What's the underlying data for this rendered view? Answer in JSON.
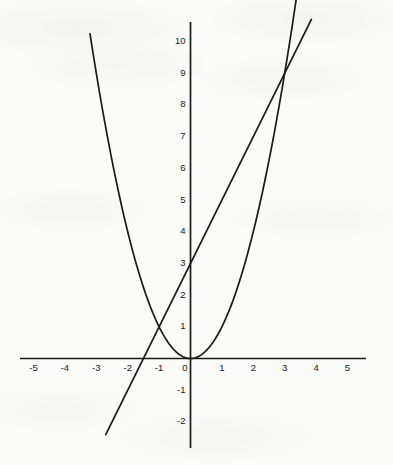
{
  "chart_data": {
    "type": "line",
    "title": "",
    "subtitle": "",
    "xlabel": "",
    "ylabel": "",
    "xlim": [
      -5.4,
      5.5
    ],
    "ylim": [
      -2.6,
      10.7
    ],
    "grid": false,
    "legend": "none",
    "x_ticks": [
      -5,
      -4,
      -3,
      -2,
      -1,
      0,
      1,
      2,
      3,
      4,
      5
    ],
    "x_tick_labels": [
      "-5",
      "-4",
      "-3",
      "-2",
      "-1",
      "0",
      "1",
      "2",
      "3",
      "4",
      "5"
    ],
    "y_ticks": [
      -2,
      -1,
      1,
      2,
      3,
      4,
      5,
      6,
      7,
      8,
      9,
      10
    ],
    "y_tick_labels": [
      "-2",
      "-1",
      "1",
      "2",
      "3",
      "4",
      "5",
      "6",
      "7",
      "8",
      "9",
      "10"
    ],
    "origin_label": "0",
    "series": [
      {
        "name": "parabola",
        "equation": "y = x^2",
        "type": "quadratic",
        "coefficients": {
          "a": 1,
          "b": 0,
          "c": 0
        },
        "x_range": [
          -3.2,
          3.45
        ],
        "vertex": [
          0,
          0
        ],
        "points": [
          [
            -3.2,
            10.24
          ],
          [
            -3.0,
            9.0
          ],
          [
            -2.5,
            6.25
          ],
          [
            -2.0,
            4.0
          ],
          [
            -1.5,
            2.25
          ],
          [
            -1.0,
            1.0
          ],
          [
            -0.5,
            0.25
          ],
          [
            0.0,
            0.0
          ],
          [
            0.5,
            0.25
          ],
          [
            1.0,
            1.0
          ],
          [
            1.5,
            2.25
          ],
          [
            2.0,
            4.0
          ],
          [
            2.5,
            6.25
          ],
          [
            3.0,
            9.0
          ],
          [
            3.45,
            11.9
          ]
        ]
      },
      {
        "name": "line",
        "equation": "y = 2x + 3",
        "type": "linear",
        "slope": 2,
        "y_intercept": 3,
        "x_intercept": -1.5,
        "x_range": [
          -2.7,
          3.85
        ],
        "points": [
          [
            -2.7,
            -2.4
          ],
          [
            0,
            3
          ],
          [
            3,
            9
          ],
          [
            3.85,
            10.7
          ]
        ]
      }
    ],
    "intersections": [
      {
        "x": -1,
        "y": 1
      },
      {
        "x": 3,
        "y": 9
      }
    ]
  },
  "axes": {
    "x_axis_name": "x-axis",
    "y_axis_name": "y-axis"
  }
}
